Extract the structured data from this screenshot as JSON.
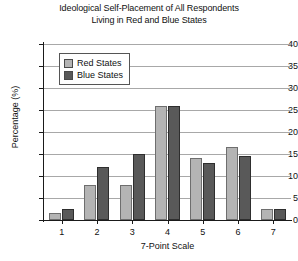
{
  "chart_data": {
    "type": "bar",
    "title": "Ideological Self-Placement of All Respondents Living in Red and Blue States",
    "title_lines": [
      "Ideological Self-Placement of All Respondents",
      "Living in Red and Blue States"
    ],
    "xlabel": "7-Point Scale",
    "ylabel": "Percentage (%)",
    "categories": [
      "1",
      "2",
      "3",
      "4",
      "5",
      "6",
      "7"
    ],
    "ylim": [
      0,
      40
    ],
    "yticks": [
      0,
      5,
      10,
      15,
      20,
      25,
      30,
      35,
      40
    ],
    "grid": true,
    "legend_position": "upper-left-inside",
    "series": [
      {
        "name": "Red States",
        "color": "#b4b4b4",
        "values": [
          1.5,
          8.0,
          8.0,
          26.0,
          14.0,
          16.5,
          2.5
        ]
      },
      {
        "name": "Blue States",
        "color": "#595959",
        "values": [
          2.5,
          12.0,
          15.0,
          26.0,
          13.0,
          14.5,
          2.5
        ]
      }
    ]
  }
}
